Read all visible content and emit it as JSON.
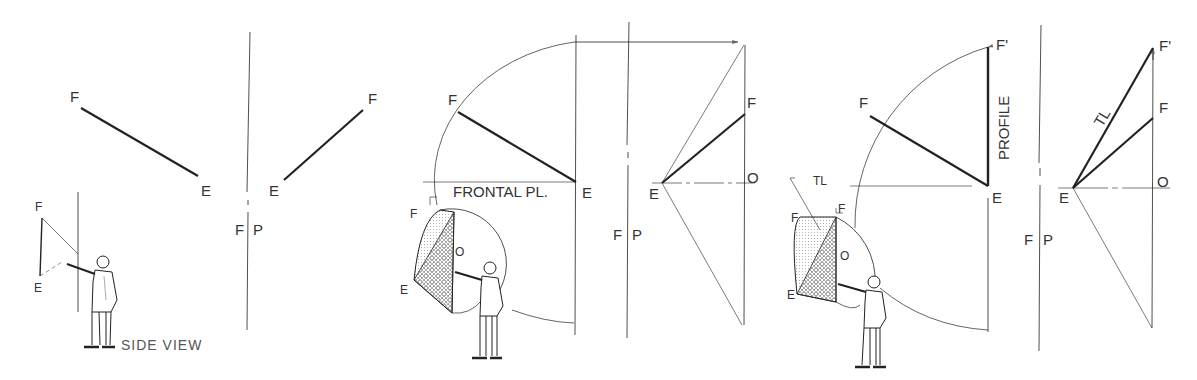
{
  "panels": [
    {
      "id": "panel-1",
      "labels": {
        "front_F": "F",
        "front_E": "E",
        "profile_F": "F",
        "profile_E": "E",
        "fold_F": "F",
        "fold_P": "P",
        "inset_F": "F",
        "inset_E": "E",
        "caption": "SIDE VIEW"
      }
    },
    {
      "id": "panel-2",
      "labels": {
        "front_F": "F",
        "front_E": "E",
        "frontal_plane": "FRONTAL PL.",
        "profile_F": "F",
        "profile_E": "E",
        "profile_O": "O",
        "fold_F": "F",
        "fold_P": "P",
        "inset_F": "F",
        "inset_E": "E",
        "inset_O": "O"
      }
    },
    {
      "id": "panel-3",
      "labels": {
        "front_F": "F",
        "front_F_prime": "F'",
        "front_E": "E",
        "profile_word": "PROFILE",
        "profile_F": "F",
        "profile_F_prime": "F'",
        "profile_E": "E",
        "profile_O": "O",
        "tl_label": "TL",
        "fold_F": "F",
        "fold_P": "P",
        "inset_TL": "TL",
        "inset_F": "F",
        "inset_F2": "F",
        "inset_E": "E",
        "inset_O": "O"
      }
    }
  ]
}
